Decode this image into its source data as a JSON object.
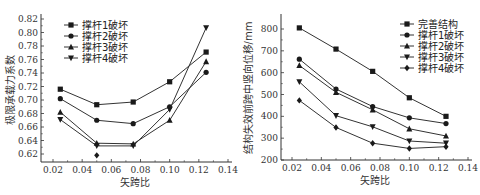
{
  "chart_data": [
    {
      "type": "line",
      "ylabel": "极限承载力系数",
      "xlabel": "矢跨比",
      "xlim": [
        0.01,
        0.14
      ],
      "ylim": [
        0.608,
        0.82
      ],
      "xticks": [
        "0.02",
        "0.04",
        "0.06",
        "0.08",
        "0.10",
        "0.12",
        "0.14"
      ],
      "xtick_values": [
        0.02,
        0.04,
        0.06,
        0.08,
        0.1,
        0.12,
        0.14
      ],
      "yticks": [
        "0.62",
        "0.64",
        "0.66",
        "0.68",
        "0.70",
        "0.72",
        "0.74",
        "0.76",
        "0.78",
        "0.80",
        "0.82"
      ],
      "ytick_values": [
        0.62,
        0.64,
        0.66,
        0.68,
        0.7,
        0.72,
        0.74,
        0.76,
        0.78,
        0.8,
        0.82
      ],
      "legend_position": "top-left",
      "x": [
        0.025,
        0.05,
        0.075,
        0.1,
        0.125
      ],
      "series": [
        {
          "name": "撑杆1破坏",
          "marker": "square",
          "values": [
            0.716,
            0.693,
            0.697,
            0.727,
            0.771
          ]
        },
        {
          "name": "撑杆2破坏",
          "marker": "circle",
          "values": [
            0.702,
            0.67,
            0.665,
            0.69,
            0.741
          ]
        },
        {
          "name": "撑杆3破坏",
          "marker": "triangle-up",
          "values": [
            0.682,
            0.636,
            0.635,
            0.67,
            0.757
          ]
        },
        {
          "name": "撑杆4破坏",
          "marker": "triangle-down",
          "values": [
            0.671,
            0.632,
            0.632,
            0.686,
            0.807
          ]
        }
      ],
      "annotations": [
        {
          "marker": "diamond",
          "x": 0.05,
          "y": 0.618
        }
      ]
    },
    {
      "type": "line",
      "ylabel": "结构失效前跨中竖向位移/mm",
      "xlabel": "矢跨比",
      "xlim": [
        0.01,
        0.14
      ],
      "ylim": [
        200,
        850
      ],
      "xticks": [
        "0.02",
        "0.04",
        "0.06",
        "0.08",
        "0.10",
        "0.12",
        "0.14"
      ],
      "xtick_values": [
        0.02,
        0.04,
        0.06,
        0.08,
        0.1,
        0.12,
        0.14
      ],
      "yticks": [
        "200",
        "300",
        "400",
        "500",
        "600",
        "700",
        "800"
      ],
      "ytick_values": [
        200,
        300,
        400,
        500,
        600,
        700,
        800
      ],
      "legend_position": "top-right",
      "x": [
        0.025,
        0.05,
        0.075,
        0.1,
        0.125
      ],
      "series": [
        {
          "name": "完善结构",
          "marker": "square",
          "values": [
            805,
            708,
            606,
            485,
            400
          ]
        },
        {
          "name": "撑杆1破坏",
          "marker": "circle",
          "values": [
            662,
            525,
            445,
            393,
            367
          ]
        },
        {
          "name": "撑杆2破坏",
          "marker": "triangle-up",
          "values": [
            633,
            510,
            430,
            343,
            310
          ]
        },
        {
          "name": "撑杆3破坏",
          "marker": "triangle-down",
          "values": [
            558,
            403,
            352,
            287,
            277
          ]
        },
        {
          "name": "撑杆4破坏",
          "marker": "diamond",
          "values": [
            473,
            349,
            277,
            253,
            261
          ]
        }
      ]
    }
  ]
}
